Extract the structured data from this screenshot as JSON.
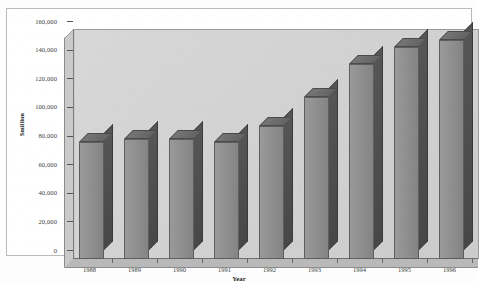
{
  "chart_data": {
    "type": "bar",
    "title": "",
    "xlabel": "Year",
    "ylabel": "$million",
    "categories": [
      "1988",
      "1989",
      "1990",
      "1991",
      "1992",
      "1993",
      "1994",
      "1995",
      "1996"
    ],
    "values": [
      82000,
      84000,
      84000,
      82000,
      93000,
      113000,
      136000,
      148000,
      153000
    ],
    "ylim": [
      0,
      160000
    ],
    "yticks": [
      0,
      20000,
      40000,
      60000,
      80000,
      100000,
      120000,
      140000,
      160000
    ],
    "ytick_labels": [
      "0",
      "20,000",
      "40,000",
      "60,000",
      "80,000",
      "100,000",
      "120,000",
      "140,000",
      "160,000"
    ],
    "grid": false,
    "legend": "none",
    "style": "3d-column",
    "series": [
      {
        "name": "$million",
        "values": [
          82000,
          84000,
          84000,
          82000,
          93000,
          113000,
          136000,
          148000,
          153000
        ]
      }
    ],
    "colors": {
      "bar_front": "#8c8c8c",
      "bar_side": "#4e4e4e",
      "bar_top": "#6e6e6e",
      "plot_background": "#d2d2d2",
      "wall": "#cacaca",
      "floor": "#b9b9b9",
      "axis": "#6f6f6f",
      "text": "#2b2b2b",
      "page_background": "#fdfdfd"
    }
  },
  "figure": {
    "title_fragment": "",
    "frame_visible": true
  }
}
